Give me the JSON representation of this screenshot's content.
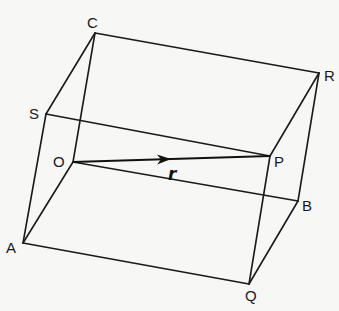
{
  "figure": {
    "background": "#f7f7f5",
    "line_color": "#1a1a1a",
    "vertices": {
      "C": {
        "label": "C",
        "x": 95,
        "y": 33,
        "lx": 87,
        "ly": 28
      },
      "S": {
        "label": "S",
        "x": 46,
        "y": 114,
        "lx": 29,
        "ly": 119
      },
      "O": {
        "label": "O",
        "x": 73,
        "y": 162,
        "lx": 53,
        "ly": 167
      },
      "A": {
        "label": "A",
        "x": 23,
        "y": 243,
        "lx": 6,
        "ly": 253
      },
      "R": {
        "label": "R",
        "x": 319,
        "y": 73,
        "lx": 324,
        "ly": 81
      },
      "P": {
        "label": "P",
        "x": 270,
        "y": 156,
        "lx": 274,
        "ly": 167
      },
      "B": {
        "label": "B",
        "x": 298,
        "y": 201,
        "lx": 302,
        "ly": 211
      },
      "Q": {
        "label": "Q",
        "x": 249,
        "y": 284,
        "lx": 245,
        "ly": 301
      }
    },
    "edges": [
      [
        "C",
        "R"
      ],
      [
        "C",
        "S"
      ],
      [
        "C",
        "O"
      ],
      [
        "S",
        "P"
      ],
      [
        "S",
        "A"
      ],
      [
        "O",
        "B"
      ],
      [
        "O",
        "A"
      ],
      [
        "R",
        "P"
      ],
      [
        "R",
        "B"
      ],
      [
        "A",
        "Q"
      ],
      [
        "P",
        "Q"
      ],
      [
        "B",
        "Q"
      ]
    ],
    "vector": {
      "from": "O",
      "to": "P",
      "label": "r",
      "label_x": 168,
      "label_y": 180,
      "arrow_x": 171,
      "arrow_y": 159
    }
  }
}
